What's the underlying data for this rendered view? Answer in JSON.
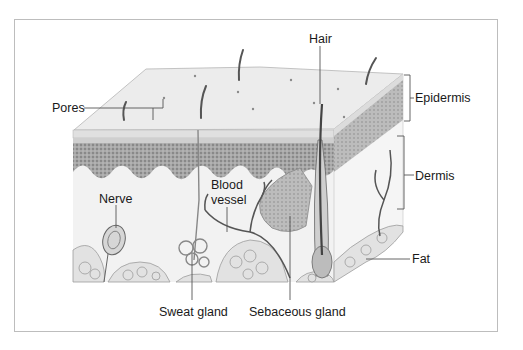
{
  "diagram": {
    "type": "anatomical cross-section",
    "colors": {
      "frame_border": "#bdbdbd",
      "epidermis_surface": "#ebebeb",
      "epidermis_layer": "#9a9a9a",
      "dermis": "#f1f1f1",
      "fat": "#d9d9d9",
      "hair": "#555555",
      "leader_line": "#555555",
      "label_text": "#1a1a1a"
    },
    "labels": {
      "pores": "Pores",
      "hair": "Hair",
      "epidermis": "Epidermis",
      "dermis": "Dermis",
      "nerve": "Nerve",
      "blood_vessel_line1": "Blood",
      "blood_vessel_line2": "vessel",
      "fat": "Fat",
      "sweat_gland": "Sweat gland",
      "sebaceous_gland": "Sebaceous gland"
    },
    "layers": [
      "Epidermis",
      "Dermis",
      "Fat"
    ],
    "structures": [
      "Pores",
      "Hair",
      "Nerve",
      "Blood vessel",
      "Sweat gland",
      "Sebaceous gland"
    ]
  }
}
